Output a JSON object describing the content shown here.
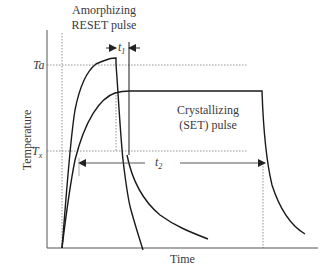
{
  "diagram": {
    "title": "",
    "x_axis_label": "Time",
    "y_axis_label": "Temperature",
    "levels": {
      "ta_label": "Ta",
      "tx_label": "T",
      "tx_subscript": "x"
    },
    "reset_pulse": {
      "line1": "Amorphizing",
      "line2": "RESET pulse"
    },
    "set_pulse": {
      "line1": "Crystallizing",
      "line2": "(SET) pulse"
    },
    "t1": {
      "label": "t",
      "subscript": "1"
    },
    "t2": {
      "label": "t",
      "subscript": "2"
    },
    "colors": {
      "curve": "#1a1a1a",
      "axis": "#555555",
      "dotted": "#777777",
      "text": "#3a3a3a"
    }
  }
}
